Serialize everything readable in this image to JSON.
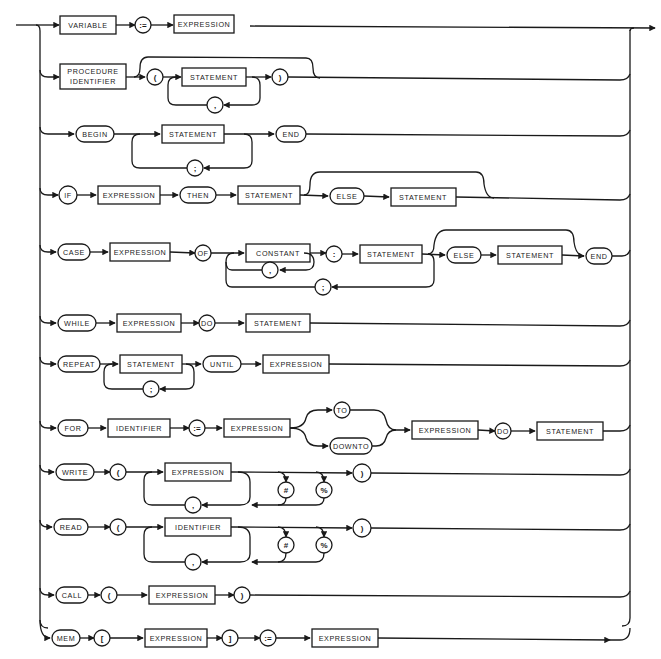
{
  "diagram": {
    "colors": {
      "ink": "#1a1a1a",
      "paper": "#ffffff"
    },
    "rows": [
      {
        "id": "assignment",
        "items": [
          {
            "kind": "box",
            "label": "VARIABLE"
          },
          {
            "kind": "term",
            "label": ":="
          },
          {
            "kind": "box",
            "label": "EXPRESSION"
          }
        ]
      },
      {
        "id": "procedure-call",
        "items": [
          {
            "kind": "box",
            "label": "PROCEDURE IDENTIFIER",
            "line1": "PROCEDURE",
            "line2": "IDENTIFIER"
          },
          {
            "kind": "term",
            "label": "("
          },
          {
            "kind": "box",
            "label": "EXPRESSION"
          },
          {
            "kind": "term",
            "label": ","
          },
          {
            "kind": "term",
            "label": ")"
          }
        ]
      },
      {
        "id": "compound",
        "items": [
          {
            "kind": "term",
            "label": "BEGIN"
          },
          {
            "kind": "box",
            "label": "STATEMENT"
          },
          {
            "kind": "term",
            "label": ";"
          },
          {
            "kind": "term",
            "label": "END"
          }
        ]
      },
      {
        "id": "if",
        "items": [
          {
            "kind": "term",
            "label": "IF"
          },
          {
            "kind": "box",
            "label": "EXPRESSION"
          },
          {
            "kind": "term",
            "label": "THEN"
          },
          {
            "kind": "box",
            "label": "STATEMENT"
          },
          {
            "kind": "term",
            "label": "ELSE"
          },
          {
            "kind": "box",
            "label": "STATEMENT"
          }
        ]
      },
      {
        "id": "case",
        "items": [
          {
            "kind": "term",
            "label": "CASE"
          },
          {
            "kind": "box",
            "label": "EXPRESSION"
          },
          {
            "kind": "term",
            "label": "OF"
          },
          {
            "kind": "box",
            "label": "CONSTANT"
          },
          {
            "kind": "term",
            "label": ","
          },
          {
            "kind": "term",
            "label": ":"
          },
          {
            "kind": "box",
            "label": "STATEMENT"
          },
          {
            "kind": "term",
            "label": ";"
          },
          {
            "kind": "term",
            "label": "ELSE"
          },
          {
            "kind": "box",
            "label": "STATEMENT"
          },
          {
            "kind": "term",
            "label": "END"
          }
        ]
      },
      {
        "id": "while",
        "items": [
          {
            "kind": "term",
            "label": "WHILE"
          },
          {
            "kind": "box",
            "label": "EXPRESSION"
          },
          {
            "kind": "term",
            "label": "DO"
          },
          {
            "kind": "box",
            "label": "STATEMENT"
          }
        ]
      },
      {
        "id": "repeat",
        "items": [
          {
            "kind": "term",
            "label": "REPEAT"
          },
          {
            "kind": "box",
            "label": "STATEMENT"
          },
          {
            "kind": "term",
            "label": ";"
          },
          {
            "kind": "term",
            "label": "UNTIL"
          },
          {
            "kind": "box",
            "label": "EXPRESSION"
          }
        ]
      },
      {
        "id": "for",
        "items": [
          {
            "kind": "term",
            "label": "FOR"
          },
          {
            "kind": "box",
            "label": "IDENTIFIER"
          },
          {
            "kind": "term",
            "label": ":="
          },
          {
            "kind": "box",
            "label": "EXPRESSION"
          },
          {
            "kind": "term",
            "label": "TO"
          },
          {
            "kind": "term",
            "label": "DOWNTO"
          },
          {
            "kind": "box",
            "label": "EXPRESSION"
          },
          {
            "kind": "term",
            "label": "DO"
          },
          {
            "kind": "box",
            "label": "STATEMENT"
          }
        ]
      },
      {
        "id": "write",
        "items": [
          {
            "kind": "term",
            "label": "WRITE"
          },
          {
            "kind": "term",
            "label": "("
          },
          {
            "kind": "box",
            "label": "EXPRESSION"
          },
          {
            "kind": "term",
            "label": ","
          },
          {
            "kind": "term",
            "label": "#"
          },
          {
            "kind": "term",
            "label": "%"
          },
          {
            "kind": "term",
            "label": ")"
          }
        ]
      },
      {
        "id": "read",
        "items": [
          {
            "kind": "term",
            "label": "READ"
          },
          {
            "kind": "term",
            "label": "("
          },
          {
            "kind": "box",
            "label": "IDENTIFIER"
          },
          {
            "kind": "term",
            "label": ","
          },
          {
            "kind": "term",
            "label": "#"
          },
          {
            "kind": "term",
            "label": "%"
          },
          {
            "kind": "term",
            "label": ")"
          }
        ]
      },
      {
        "id": "call",
        "items": [
          {
            "kind": "term",
            "label": "CALL"
          },
          {
            "kind": "term",
            "label": "("
          },
          {
            "kind": "box",
            "label": "EXPRESSION"
          },
          {
            "kind": "term",
            "label": ")"
          }
        ]
      },
      {
        "id": "mem",
        "items": [
          {
            "kind": "term",
            "label": "MEM"
          },
          {
            "kind": "term",
            "label": "["
          },
          {
            "kind": "box",
            "label": "EXPRESSION"
          },
          {
            "kind": "term",
            "label": "]"
          },
          {
            "kind": "term",
            "label": ":="
          },
          {
            "kind": "box",
            "label": "EXPRESSION"
          }
        ]
      }
    ]
  }
}
